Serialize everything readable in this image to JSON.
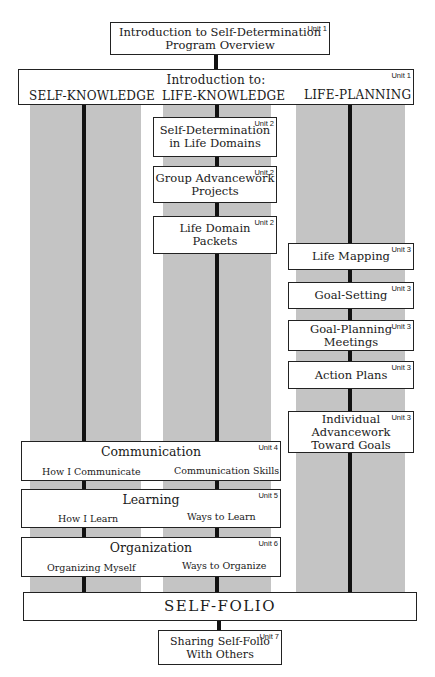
{
  "top": {
    "title_line1": "Introduction to Self-Determination",
    "title_line2": "Program Overview",
    "unit": "Unit 1"
  },
  "intro_bar": {
    "title": "Introduction to:",
    "unit": "Unit 1",
    "columns": [
      "SELF-KNOWLEDGE",
      "LIFE-KNOWLEDGE",
      "LIFE-PLANNING"
    ]
  },
  "life_knowledge": [
    {
      "line1": "Self-Determination",
      "line2": "in Life Domains",
      "unit": "Unit 2"
    },
    {
      "line1": "Group Advancework",
      "line2": "Projects",
      "unit": "Unit 2"
    },
    {
      "line1": "Life Domain",
      "line2": "Packets",
      "unit": "Unit 2"
    }
  ],
  "life_planning": [
    {
      "line1": "Life Mapping",
      "unit": "Unit 3"
    },
    {
      "line1": "Goal-Setting",
      "unit": "Unit 3"
    },
    {
      "line1": "Goal-Planning",
      "line2": "Meetings",
      "unit": "Unit 3"
    },
    {
      "line1": "Action Plans",
      "unit": "Unit 3"
    },
    {
      "line1": "Individual",
      "line2": "Advancework",
      "line3": "Toward Goals",
      "unit": "Unit 3"
    }
  ],
  "self_knowledge": [
    {
      "title": "Communication",
      "left": "How I Communicate",
      "right": "Communication Skills",
      "unit": "Unit 4"
    },
    {
      "title": "Learning",
      "left": "How I Learn",
      "right": "Ways to Learn",
      "unit": "Unit 5"
    },
    {
      "title": "Organization",
      "left": "Organizing Myself",
      "right": "Ways to Organize",
      "unit": "Unit 6"
    }
  ],
  "self_folio": {
    "title": "SELF-FOLIO"
  },
  "sharing": {
    "line1": "Sharing Self-Folio",
    "line2": "With Others",
    "unit": "Unit 7"
  },
  "colors": {
    "column_gray": "#c4c4c4",
    "line": "#111111",
    "border": "#222222"
  }
}
